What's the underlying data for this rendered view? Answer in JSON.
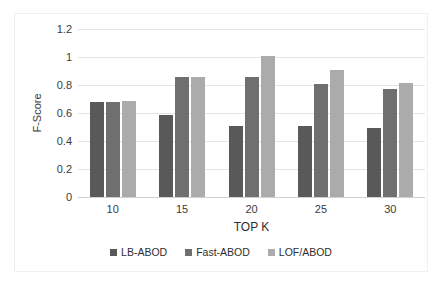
{
  "chart_data": {
    "type": "bar",
    "title": "",
    "xlabel": "TOP K",
    "ylabel": "F-Score",
    "categories": [
      "10",
      "15",
      "20",
      "25",
      "30"
    ],
    "series": [
      {
        "name": "LB-ABOD",
        "color": "#595959",
        "values": [
          0.68,
          0.585,
          0.505,
          0.51,
          0.49
        ]
      },
      {
        "name": "Fast-ABOD",
        "color": "#6f6f6f",
        "values": [
          0.68,
          0.855,
          0.86,
          0.81,
          0.775
        ]
      },
      {
        "name": "LOF/ABOD",
        "color": "#ababab",
        "values": [
          0.685,
          0.855,
          1.01,
          0.91,
          0.815
        ]
      }
    ],
    "ylim": [
      0,
      1.2
    ],
    "yticks": [
      "0",
      "0.2",
      "0.4",
      "0.6",
      "0.8",
      "1",
      "1.2"
    ],
    "ytick_values": [
      0,
      0.2,
      0.4,
      0.6,
      0.8,
      1,
      1.2
    ],
    "grid": true,
    "legend_position": "bottom"
  }
}
